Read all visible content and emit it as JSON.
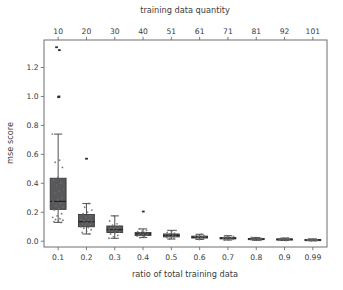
{
  "figure": {
    "background_color": "#ffffff",
    "axes_background_color": "#ffffff",
    "spine_color": "#6e6e6e",
    "box_fill_color": "#59595b",
    "box_edge_color": "#3a3a3c",
    "median_color": "#232325",
    "flier_color": "#2f2f31",
    "text_color": "#3b3b3b"
  },
  "chart_data": {
    "type": "box",
    "title": "",
    "xlabel": "ratio of total training data",
    "ylabel": "mse score",
    "secondary_xlabel": "training data quantity",
    "categories": [
      "0.1",
      "0.2",
      "0.3",
      "0.4",
      "0.5",
      "0.6",
      "0.7",
      "0.8",
      "0.9",
      "0.99"
    ],
    "secondary_categories": [
      "10",
      "20",
      "30",
      "40",
      "51",
      "61",
      "71",
      "81",
      "92",
      "101"
    ],
    "yticks": [
      "0.0",
      "0.2",
      "0.4",
      "0.6",
      "0.8",
      "1.0",
      "1.2"
    ],
    "ytick_values": [
      0.0,
      0.2,
      0.4,
      0.6,
      0.8,
      1.0,
      1.2
    ],
    "ylim": [
      -0.04,
      1.39
    ],
    "grid": false,
    "legend": null,
    "legend_position": "none",
    "boxes": [
      {
        "category": "0.1",
        "quantity": 10,
        "whisker_low": 0.13,
        "q1": 0.22,
        "median": 0.275,
        "q3": 0.435,
        "whisker_high": 0.74,
        "fliers": [
          1.34,
          1.32,
          1.0,
          0.995
        ]
      },
      {
        "category": "0.2",
        "quantity": 20,
        "whisker_low": 0.05,
        "q1": 0.1,
        "median": 0.135,
        "q3": 0.185,
        "whisker_high": 0.26,
        "fliers": [
          0.57
        ]
      },
      {
        "category": "0.3",
        "quantity": 30,
        "whisker_low": 0.02,
        "q1": 0.06,
        "median": 0.08,
        "q3": 0.105,
        "whisker_high": 0.175,
        "fliers": []
      },
      {
        "category": "0.4",
        "quantity": 40,
        "whisker_low": 0.025,
        "q1": 0.04,
        "median": 0.05,
        "q3": 0.06,
        "whisker_high": 0.085,
        "fliers": [
          0.205
        ]
      },
      {
        "category": "0.5",
        "quantity": 51,
        "whisker_low": 0.015,
        "q1": 0.03,
        "median": 0.04,
        "q3": 0.05,
        "whisker_high": 0.075,
        "fliers": []
      },
      {
        "category": "0.6",
        "quantity": 61,
        "whisker_low": 0.012,
        "q1": 0.022,
        "median": 0.028,
        "q3": 0.035,
        "whisker_high": 0.048,
        "fliers": []
      },
      {
        "category": "0.7",
        "quantity": 71,
        "whisker_low": 0.008,
        "q1": 0.016,
        "median": 0.02,
        "q3": 0.026,
        "whisker_high": 0.038,
        "fliers": []
      },
      {
        "category": "0.8",
        "quantity": 81,
        "whisker_low": 0.006,
        "q1": 0.012,
        "median": 0.015,
        "q3": 0.019,
        "whisker_high": 0.026,
        "fliers": []
      },
      {
        "category": "0.9",
        "quantity": 92,
        "whisker_low": 0.005,
        "q1": 0.01,
        "median": 0.013,
        "q3": 0.016,
        "whisker_high": 0.022,
        "fliers": []
      },
      {
        "category": "0.99",
        "quantity": 101,
        "whisker_low": 0.003,
        "q1": 0.007,
        "median": 0.009,
        "q3": 0.012,
        "whisker_high": 0.016,
        "fliers": []
      }
    ],
    "scatter_overlay": {
      "present": true,
      "description": "individual run points jittered over each box",
      "points": [
        {
          "category": "0.1",
          "values": [
            0.74,
            0.56,
            0.545,
            0.51,
            0.44,
            0.425,
            0.4,
            0.385,
            0.36,
            0.345,
            0.33,
            0.3,
            0.285,
            0.275,
            0.26,
            0.245,
            0.235,
            0.225,
            0.215,
            0.19,
            0.175,
            0.165,
            0.155,
            0.15,
            0.145,
            0.14,
            0.135,
            0.13
          ]
        },
        {
          "category": "0.2",
          "values": [
            0.26,
            0.235,
            0.215,
            0.2,
            0.19,
            0.175,
            0.165,
            0.15,
            0.145,
            0.14,
            0.135,
            0.13,
            0.12,
            0.115,
            0.11,
            0.1,
            0.095,
            0.09,
            0.08,
            0.07,
            0.06,
            0.05
          ]
        },
        {
          "category": "0.3",
          "values": [
            0.175,
            0.14,
            0.12,
            0.11,
            0.105,
            0.1,
            0.095,
            0.09,
            0.085,
            0.08,
            0.075,
            0.07,
            0.065,
            0.06,
            0.05,
            0.04,
            0.03,
            0.02
          ]
        },
        {
          "category": "0.4",
          "values": [
            0.085,
            0.075,
            0.07,
            0.065,
            0.06,
            0.055,
            0.05,
            0.048,
            0.045,
            0.042,
            0.04,
            0.035,
            0.03,
            0.025
          ]
        },
        {
          "category": "0.5",
          "values": [
            0.075,
            0.065,
            0.06,
            0.055,
            0.05,
            0.045,
            0.04,
            0.038,
            0.035,
            0.03,
            0.025,
            0.02,
            0.015
          ]
        },
        {
          "category": "0.6",
          "values": [
            0.048,
            0.042,
            0.038,
            0.035,
            0.032,
            0.03,
            0.028,
            0.025,
            0.022,
            0.018,
            0.015,
            0.012
          ]
        },
        {
          "category": "0.7",
          "values": [
            0.038,
            0.033,
            0.03,
            0.027,
            0.024,
            0.022,
            0.02,
            0.018,
            0.016,
            0.013,
            0.01,
            0.008
          ]
        },
        {
          "category": "0.8",
          "values": [
            0.026,
            0.023,
            0.021,
            0.019,
            0.017,
            0.016,
            0.015,
            0.013,
            0.012,
            0.01,
            0.008,
            0.006
          ]
        },
        {
          "category": "0.9",
          "values": [
            0.022,
            0.02,
            0.018,
            0.017,
            0.016,
            0.014,
            0.013,
            0.012,
            0.011,
            0.009,
            0.007,
            0.005
          ]
        },
        {
          "category": "0.99",
          "values": [
            0.016,
            0.015,
            0.013,
            0.012,
            0.011,
            0.01,
            0.009,
            0.008,
            0.007,
            0.006,
            0.005,
            0.003
          ]
        }
      ]
    }
  }
}
